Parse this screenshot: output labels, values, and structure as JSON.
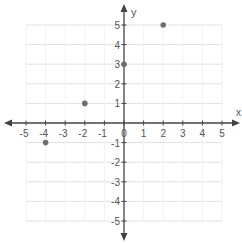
{
  "chart_data": {
    "type": "scatter",
    "title": "",
    "xlabel": "x",
    "ylabel": "y",
    "xlim": [
      -5,
      5
    ],
    "ylim": [
      -5,
      5
    ],
    "grid": true,
    "x_ticks": [
      -5,
      -4,
      -3,
      -2,
      -1,
      0,
      1,
      2,
      3,
      4,
      5
    ],
    "y_ticks": [
      -5,
      -4,
      -3,
      -2,
      -1,
      1,
      2,
      3,
      4,
      5
    ],
    "series": [
      {
        "name": "points",
        "x": [
          -4,
          -2,
          0,
          2
        ],
        "y": [
          -1,
          1,
          3,
          5
        ]
      }
    ]
  },
  "colors": {
    "axis": "#444444",
    "grid": "#e2e2e2",
    "point": "#6e6e6e",
    "label": "#555555"
  }
}
